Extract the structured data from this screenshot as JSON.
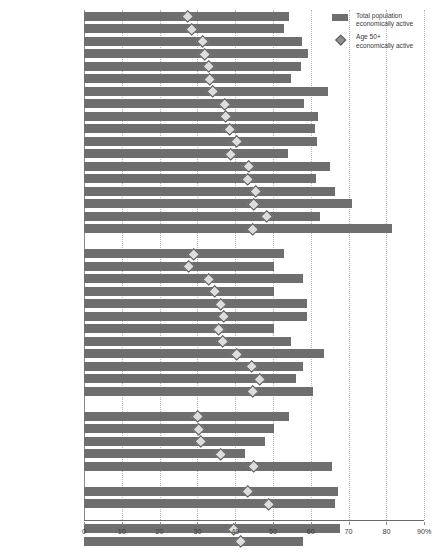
{
  "chart_data": {
    "type": "bar",
    "title": "",
    "xlabel": "",
    "ylabel": "",
    "xlim": [
      0,
      90
    ],
    "xticks": [
      0,
      10,
      20,
      30,
      40,
      50,
      60,
      70,
      80,
      90
    ],
    "xticklabels": [
      "0",
      "10",
      "20",
      "30",
      "40",
      "50",
      "60",
      "70",
      "80",
      "90%"
    ],
    "grid": true,
    "orientation": "horizontal",
    "legend_position": "top-right",
    "series": [
      {
        "name": "Total population economically active",
        "kind": "bar",
        "color": "#6e6e6e",
        "values": [
          54.2,
          52.9,
          57.7,
          59.3,
          57.4,
          54.8,
          64.6,
          58.2,
          61.9,
          61.1,
          61.6,
          54.0,
          65.1,
          61.4,
          66.4,
          70.9,
          62.4,
          81.5,
          52.9,
          50.3,
          57.9,
          50.3,
          59.0,
          59.0,
          50.3,
          54.8,
          63.5,
          57.9,
          56.1,
          60.6,
          54.2,
          50.3,
          47.9,
          42.6,
          65.6,
          67.2,
          66.4,
          67.7,
          57.9
        ]
      },
      {
        "name": "Age 50+ economically active",
        "kind": "marker",
        "marker": "diamond",
        "color": "#dddddd",
        "edgecolor": "#5a5a5a",
        "values": [
          27.2,
          28.3,
          31.2,
          31.7,
          32.8,
          33.1,
          33.9,
          37.0,
          37.3,
          38.4,
          40.2,
          38.6,
          43.4,
          43.1,
          45.2,
          44.7,
          48.1,
          44.4,
          28.8,
          27.5,
          32.8,
          34.4,
          36.0,
          36.8,
          35.4,
          36.5,
          40.2,
          44.2,
          46.3,
          44.4,
          29.9,
          30.2,
          30.7,
          36.0,
          44.7,
          43.1,
          48.7,
          39.4,
          41.3
        ]
      }
    ],
    "groups": [
      {
        "name": "Western & Northern Europe",
        "categories": [
          "Belgium",
          "Italy",
          "France",
          "Austria",
          "Spain",
          "Greece",
          "Netherlands",
          "Germany",
          "Ireland",
          "Finland",
          "United Kingdom",
          "Luxemburg",
          "Denmark",
          "Portugal",
          "Switzerland",
          "Norway",
          "Sweden",
          "Iceland"
        ]
      },
      {
        "name": "Central & Eastern Europe",
        "categories": [
          "Poland",
          "Hungary",
          "Slovenia",
          "Bulgaria",
          "Czech Republic",
          "Slovakia",
          "Malta",
          "Romania",
          "Cyprus",
          "Latvia",
          "Lithaunia",
          "Estonia"
        ]
      },
      {
        "name": "South-Eastern Europe & Russia",
        "categories": [
          "Macedonia FYR",
          "Serbia",
          "Croatia",
          "Bosnia /Herzegovina",
          "Russian Federation"
        ]
      },
      {
        "name": "North America",
        "categories": [
          "Canada",
          "USA"
        ]
      },
      {
        "name": "Aggregates",
        "categories": [
          "OECD",
          "EU 15"
        ]
      }
    ]
  },
  "legend": {
    "items": [
      {
        "icon": "bar-swatch",
        "line1": "Total population",
        "line2": "economically active"
      },
      {
        "icon": "diamond-marker",
        "line1": "Age 50+",
        "line2": "economically active"
      }
    ]
  }
}
